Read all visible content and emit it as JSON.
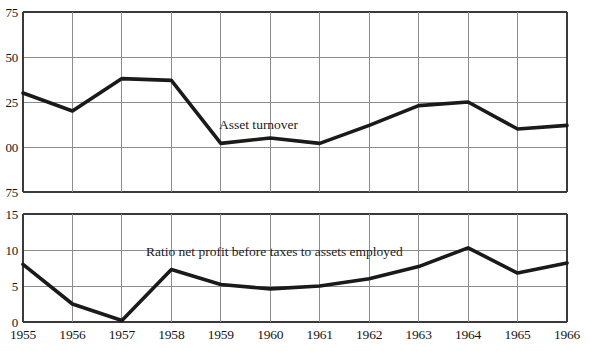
{
  "figure": {
    "background_color": "#ffffff",
    "ink_color": "#151515",
    "grid_color": "#8d8d8d",
    "series_color": "#1a1a1a"
  },
  "chart_data": [
    {
      "type": "line",
      "id": "asset-turnover",
      "title": "",
      "annotation": "Asset turnover",
      "xlabel": "",
      "ylabel": "",
      "grid": true,
      "legend_position": "inline-annotation",
      "x": [
        1955,
        1956,
        1957,
        1958,
        1959,
        1960,
        1961,
        1962,
        1963,
        1964,
        1965,
        1966
      ],
      "categories": [
        "1955",
        "1956",
        "1957",
        "1958",
        "1959",
        "1960",
        "1961",
        "1962",
        "1963",
        "1964",
        "1965",
        "1966"
      ],
      "values": [
        1.3,
        1.2,
        1.38,
        1.37,
        1.02,
        1.05,
        1.02,
        1.12,
        1.23,
        1.25,
        1.1,
        1.12
      ],
      "ylim": [
        0.75,
        1.75
      ],
      "yticks": [
        1.75,
        1.5,
        1.25,
        1.0,
        0.75
      ],
      "ytick_labels": [
        "1.75",
        "1.50",
        "1.25",
        "1.00",
        ".75"
      ],
      "ytick_labels_clipped": [
        "75",
        "50",
        "25",
        "00",
        "75"
      ]
    },
    {
      "type": "line",
      "id": "profit-to-assets-ratio",
      "title": "",
      "annotation": "Ratio net profit before taxes to assets employed",
      "xlabel": "",
      "ylabel": "",
      "grid": true,
      "legend_position": "inline-annotation",
      "x": [
        1955,
        1956,
        1957,
        1958,
        1959,
        1960,
        1961,
        1962,
        1963,
        1964,
        1965,
        1966
      ],
      "categories": [
        "1955",
        "1956",
        "1957",
        "1958",
        "1959",
        "1960",
        "1961",
        "1962",
        "1963",
        "1964",
        "1965",
        "1966"
      ],
      "values": [
        8.0,
        2.5,
        0.2,
        7.3,
        5.2,
        4.6,
        5.0,
        6.0,
        7.7,
        10.3,
        6.8,
        8.2
      ],
      "ylim": [
        0,
        15
      ],
      "yticks": [
        15,
        10,
        5,
        0
      ],
      "ytick_labels": [
        "15",
        "10",
        "5",
        "0"
      ]
    }
  ],
  "top_chart": {
    "annotation": "Asset turnover",
    "ytick_labels": [
      "75",
      "50",
      "25",
      "00",
      "75"
    ]
  },
  "bottom_chart": {
    "annotation": "Ratio net profit before taxes to assets employed",
    "ytick_labels": [
      "15",
      "10",
      "5",
      "0"
    ]
  },
  "xaxis": {
    "labels": [
      "1955",
      "1956",
      "1957",
      "1958",
      "1959",
      "1960",
      "1961",
      "1962",
      "1963",
      "1964",
      "1965",
      "1966"
    ]
  }
}
